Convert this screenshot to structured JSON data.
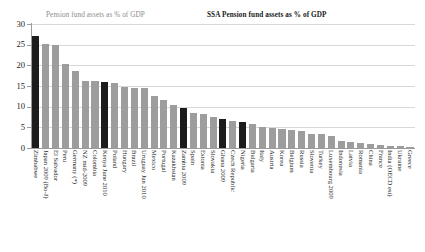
{
  "legend": {
    "series_1_label": "Pension fund assets as % of GDP",
    "series_1_color": "#9d9d9d",
    "series_2_label": "SSA Pension fund assets as % of GDP",
    "series_2_color": "#1c1c1c"
  },
  "axis": {
    "y_ticks": [
      "30",
      "25",
      "20",
      "15",
      "10",
      "5",
      "0"
    ]
  },
  "chart_data": {
    "type": "bar",
    "title": "",
    "subtitle": "",
    "xlabel": "",
    "ylabel": "",
    "ylim": [
      0,
      30
    ],
    "ytick_values": [
      0,
      5,
      10,
      15,
      20,
      25,
      30
    ],
    "grid": true,
    "legend_position": "top",
    "highlight_group": "SSA",
    "highlight_color": "#1c1c1c",
    "base_color": "#9d9d9d",
    "categories": [
      "Zimbabwe",
      "Japan 2009 (Bo-J)",
      "El Salvador",
      "Peru",
      "Germany (*)",
      "NZ mid-2009",
      "Colombia",
      "Kenya June 2010",
      "Poland",
      "Hungary",
      "Brazil",
      "Uruguay Jun 2010",
      "Mexico",
      "Portugal",
      "Kazakhstan",
      "Zambia 2009",
      "Spain",
      "Estonia",
      "Slovakia",
      "Ghana 2009",
      "Czech Republic",
      "Nigeria",
      "Bulgaria",
      "Italy",
      "Austria",
      "Korea",
      "Belgium",
      "Russia",
      "Slovenia",
      "Turkey",
      "Luxembourg 2009",
      "Indonesia",
      "Latvia",
      "Romania",
      "China",
      "France",
      "India (OECD est)",
      "Ukraine",
      "Greece"
    ],
    "values": [
      27.0,
      25.2,
      25.0,
      20.3,
      18.6,
      16.3,
      16.1,
      16.0,
      15.8,
      14.7,
      14.4,
      14.4,
      12.6,
      11.5,
      10.3,
      9.7,
      8.5,
      8.2,
      7.5,
      7.0,
      6.6,
      6.4,
      5.8,
      5.1,
      4.9,
      4.7,
      4.3,
      4.1,
      3.5,
      3.3,
      3.0,
      1.6,
      1.4,
      1.2,
      0.9,
      0.8,
      0.6,
      0.4,
      0.2
    ],
    "ssa_flags": [
      true,
      false,
      false,
      false,
      false,
      false,
      false,
      true,
      false,
      false,
      false,
      false,
      false,
      false,
      false,
      true,
      false,
      false,
      false,
      true,
      false,
      true,
      false,
      false,
      false,
      false,
      false,
      false,
      false,
      false,
      false,
      false,
      false,
      false,
      false,
      false,
      false,
      false,
      false
    ],
    "series": [
      {
        "name": "Pension fund assets as % of GDP",
        "color": "#9d9d9d"
      },
      {
        "name": "SSA Pension fund assets as % of GDP",
        "color": "#1c1c1c"
      }
    ]
  }
}
